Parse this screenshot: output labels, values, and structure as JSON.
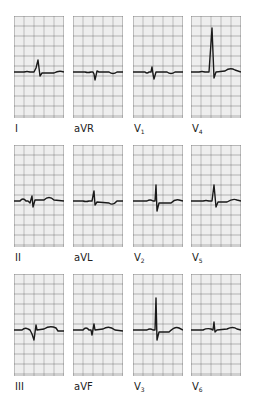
{
  "figure": {
    "type": "12-lead ECG",
    "grid": {
      "minor_px": 2,
      "major_px": 10,
      "minor_color": "#cfcfcf",
      "major_color": "#8a8a8a"
    },
    "trace_color": "#1a1a1a",
    "leads": [
      {
        "id": "I",
        "label": "I",
        "sub": ""
      },
      {
        "id": "aVR",
        "label": "aVR",
        "sub": ""
      },
      {
        "id": "V1",
        "label": "V",
        "sub": "1"
      },
      {
        "id": "V4",
        "label": "V",
        "sub": "4"
      },
      {
        "id": "II",
        "label": "II",
        "sub": ""
      },
      {
        "id": "aVL",
        "label": "aVL",
        "sub": ""
      },
      {
        "id": "V2",
        "label": "V",
        "sub": "2"
      },
      {
        "id": "V5",
        "label": "V",
        "sub": "5"
      },
      {
        "id": "III",
        "label": "III",
        "sub": ""
      },
      {
        "id": "aVF",
        "label": "aVF",
        "sub": ""
      },
      {
        "id": "V3",
        "label": "V",
        "sub": "3"
      },
      {
        "id": "V6",
        "label": "V",
        "sub": "6"
      }
    ]
  }
}
